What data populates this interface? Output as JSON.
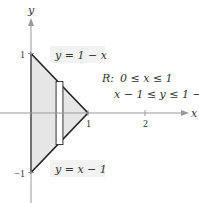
{
  "figure": {
    "axes": {
      "x_label": "x",
      "y_label": "y",
      "x_ticks": [
        {
          "value": 1,
          "label": "1"
        },
        {
          "value": 2,
          "label": "2"
        }
      ],
      "y_ticks": [
        {
          "value": 1,
          "label": "1"
        },
        {
          "value": -1,
          "label": "−1"
        }
      ],
      "x_range": [
        -0.5,
        2.6
      ],
      "y_range": [
        -1.4,
        2.0
      ]
    },
    "region": {
      "vertices": [
        [
          0,
          1
        ],
        [
          1,
          0
        ],
        [
          0,
          -1
        ]
      ],
      "fill_color": "#e6e6e6",
      "edge_color": "#222222"
    },
    "representative_rectangle": {
      "x_from": 0.44,
      "x_to": 0.56,
      "y_from": -0.53,
      "y_to": 0.53
    },
    "labels": {
      "upper_curve": "y = 1 − x",
      "lower_curve": "y = x − 1",
      "region_name": "R:",
      "region_line1": "0 ≤ x ≤ 1",
      "region_line2": "x − 1 ≤ y ≤ 1 − x"
    },
    "colors": {
      "axis": "#999999",
      "label_box": "#f2f2f2"
    }
  }
}
